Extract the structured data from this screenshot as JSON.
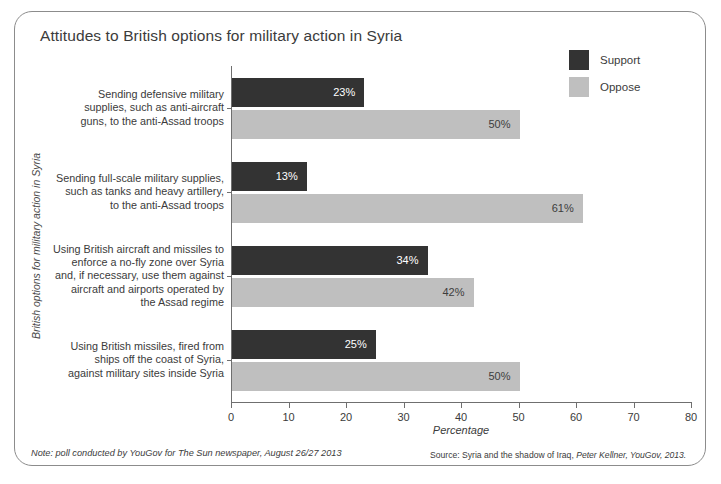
{
  "chart_data": {
    "type": "bar",
    "orientation": "horizontal",
    "title": "Attitudes to British options for military action in Syria",
    "xlabel": "Percentage",
    "ylabel": "British options for military action in Syria",
    "xlim": [
      0,
      80
    ],
    "xticks": [
      "0",
      "10",
      "20",
      "30",
      "40",
      "50",
      "60",
      "70",
      "80"
    ],
    "grid": false,
    "legend_position": "top-right",
    "categories": [
      "Sending defensive military supplies, such as anti-aircraft guns, to the anti-Assad troops",
      "Sending full-scale military supplies, such as tanks and heavy artillery, to the anti-Assad troops",
      "Using British aircraft and missiles to enforce a no-fly zone over Syria and, if necessary, use them against aircraft and airports operated by the Assad regime",
      "Using British missiles, fired from ships off the coast of Syria, against military sites inside Syria"
    ],
    "category_lines": [
      [
        "Sending defensive military",
        "supplies, such as anti-aircraft",
        "guns, to the anti-Assad troops"
      ],
      [
        "Sending full-scale military supplies,",
        "such as tanks and heavy artillery,",
        "to the anti-Assad troops"
      ],
      [
        "Using British aircraft and missiles to",
        "enforce a no-fly zone over Syria",
        "and, if necessary, use them against",
        "aircraft and airports operated by",
        "the Assad regime"
      ],
      [
        "Using British missiles, fired from",
        "ships off the coast of Syria,",
        "against military sites inside Syria"
      ]
    ],
    "series": [
      {
        "name": "Support",
        "color": "#333333",
        "values": [
          23,
          13,
          34,
          25
        ],
        "labels": [
          "23%",
          "13%",
          "34%",
          "25%"
        ]
      },
      {
        "name": "Oppose",
        "color": "#bfbfbf",
        "values": [
          50,
          61,
          42,
          50
        ],
        "labels": [
          "50%",
          "61%",
          "42%",
          "50%"
        ]
      }
    ]
  },
  "legend": {
    "items": [
      {
        "label": "Support",
        "color": "#333333"
      },
      {
        "label": "Oppose",
        "color": "#bfbfbf"
      }
    ]
  },
  "footer": {
    "note": "Note: poll conducted by YouGov for The Sun newspaper, August 26/27 2013",
    "source_prefix": "Source: Syria and the shadow of Iraq, ",
    "source_author": "Peter Kellner, YouGov, 2013."
  }
}
